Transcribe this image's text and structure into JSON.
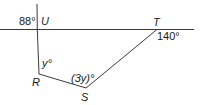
{
  "diagram": {
    "colors": {
      "line": "#3a3a3a",
      "text": "#1a1a1a",
      "background": "#ffffff"
    },
    "points": {
      "U": {
        "label": "U"
      },
      "T": {
        "label": "T"
      },
      "R": {
        "label": "R"
      },
      "S": {
        "label": "S"
      }
    },
    "angles": {
      "exterior_U": "88°",
      "exterior_T": "140°",
      "interior_R": "y°",
      "interior_S": "(3y)°"
    },
    "lines": [
      {
        "name": "horizontal-line",
        "through": [
          "U",
          "T"
        ]
      },
      {
        "name": "vertical-line",
        "through": [
          "U",
          "R"
        ]
      },
      {
        "name": "segment-RS",
        "through": [
          "R",
          "S"
        ]
      },
      {
        "name": "segment-ST",
        "through": [
          "S",
          "T"
        ]
      }
    ]
  }
}
